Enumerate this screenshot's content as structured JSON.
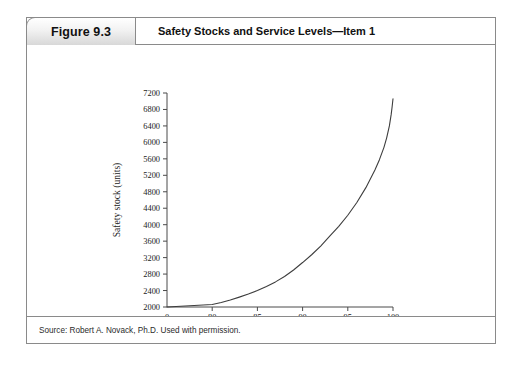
{
  "figure": {
    "number_label": "Figure 9.3",
    "title": "Safety Stocks and Service Levels—Item 1",
    "source": "Source: Robert A. Novack, Ph.D. Used with permission."
  },
  "chart_data": {
    "type": "line",
    "title": "Safety Stocks and Service Levels—Item 1",
    "xlabel": "Service level (%)",
    "ylabel": "Safety stock (units)",
    "xlim": [
      0,
      100
    ],
    "ylim": [
      2000,
      7200
    ],
    "grid": false,
    "legend": null,
    "axis_break": "x-axis jumps from 0 directly to 80",
    "x_ticks": [
      "0",
      "80",
      "85",
      "90",
      "95",
      "100"
    ],
    "y_ticks": [
      "2000",
      "2400",
      "2800",
      "3200",
      "3600",
      "4000",
      "4400",
      "4800",
      "5200",
      "5600",
      "6000",
      "6400",
      "6800",
      "7200"
    ],
    "series": [
      {
        "name": "Safety stock",
        "color": "#3d3d3d",
        "x": [
          0,
          80,
          81,
          82,
          83,
          84,
          85,
          86,
          87,
          88,
          89,
          90,
          91,
          92,
          93,
          94,
          95,
          96,
          97,
          98,
          98.5,
          99,
          99.3,
          99.6,
          99.8,
          99.9,
          100
        ],
        "values": [
          2000,
          2060,
          2110,
          2170,
          2240,
          2315,
          2400,
          2500,
          2610,
          2740,
          2900,
          3080,
          3270,
          3480,
          3720,
          3960,
          4230,
          4540,
          4900,
          5330,
          5580,
          5880,
          6110,
          6400,
          6680,
          6860,
          7060
        ]
      }
    ]
  },
  "colors": {
    "curve": "#3d3d3d",
    "axis": "#4a4a4a",
    "border": "#8a8a8a",
    "text": "#111111"
  }
}
